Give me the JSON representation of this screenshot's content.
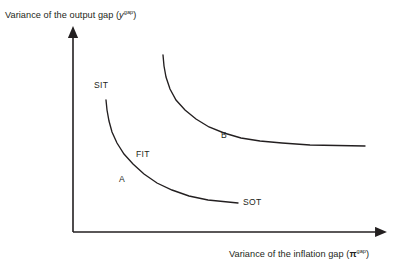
{
  "figure": {
    "background_color": "#ffffff",
    "stroke_color": "#231f20",
    "text_color": "#231f20"
  },
  "axes": {
    "y": {
      "label_prefix": "Variance of the output gap (",
      "label_symbol": "y",
      "label_superscript": "gap",
      "label_suffix": ")",
      "full_label": "Variance of the output gap (y^gap)",
      "arrow": "up-arrow"
    },
    "x": {
      "label_prefix": "Variance of the inflation gap (",
      "label_symbol": "π",
      "label_superscript": "gap",
      "label_suffix": ")",
      "full_label": "Variance of the inflation gap (π^gap)",
      "arrow": "right-arrow"
    }
  },
  "labels": {
    "sit": "SIT",
    "fit": "FIT",
    "sot": "SOT",
    "point_a": "A",
    "point_b": "B"
  },
  "chart_data": {
    "type": "line",
    "title": "",
    "xlabel": "Variance of the inflation gap (π^gap)",
    "ylabel": "Variance of the output gap (y^gap)",
    "grid": false,
    "legend": "none",
    "axis_origin_px": [
      73,
      232
    ],
    "xlim_px": [
      73,
      383
    ],
    "ylim_px": [
      232,
      32
    ],
    "annotations": [
      {
        "text": "SIT",
        "x_px": 94,
        "y_px": 81,
        "describes": "strict inflation targeting end of inner frontier"
      },
      {
        "text": "FIT",
        "x_px": 136,
        "y_px": 150,
        "describes": "flexible inflation targeting region of inner frontier"
      },
      {
        "text": "SOT",
        "x_px": 243,
        "y_px": 198,
        "describes": "strict output targeting end of inner frontier"
      },
      {
        "text": "A",
        "x_px": 119,
        "y_px": 175,
        "describes": "point on inner frontier"
      },
      {
        "text": "B",
        "x_px": 221,
        "y_px": 131,
        "describes": "point on outer frontier"
      }
    ],
    "series": [
      {
        "name": "inner-frontier",
        "label": "FIT",
        "note": "Taylor curve, efficient policy frontier",
        "points_px": [
          [
            106,
            100
          ],
          [
            107,
            110
          ],
          [
            109,
            121
          ],
          [
            112,
            132
          ],
          [
            117,
            143
          ],
          [
            124,
            154
          ],
          [
            133,
            164
          ],
          [
            144,
            174
          ],
          [
            157,
            183
          ],
          [
            172,
            190
          ],
          [
            189,
            196
          ],
          [
            208,
            200
          ],
          [
            238,
            203
          ]
        ]
      },
      {
        "name": "outer-frontier",
        "label": "B",
        "note": "shifted-out Taylor curve, inefficient / worse tradeoff",
        "points_px": [
          [
            163,
            55
          ],
          [
            164,
            66
          ],
          [
            166,
            77
          ],
          [
            170,
            89
          ],
          [
            176,
            100
          ],
          [
            185,
            110
          ],
          [
            196,
            119
          ],
          [
            209,
            127
          ],
          [
            224,
            133
          ],
          [
            241,
            138
          ],
          [
            260,
            141
          ],
          [
            282,
            143
          ],
          [
            310,
            145
          ],
          [
            365,
            146
          ]
        ]
      }
    ]
  }
}
